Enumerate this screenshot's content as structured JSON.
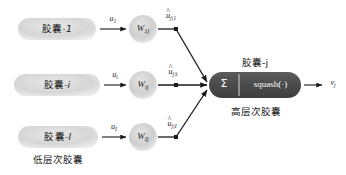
{
  "figure": {
    "type": "capsule-network-routing-diagram",
    "background": "#ffffff",
    "colors": {
      "low_capsule_fill": "#d9d9d9",
      "weight_circle_fill": "#d0d0d0",
      "high_capsule_fill": "#4d4d4d",
      "edge": "#1a1a1a",
      "text": "#1a1a1a",
      "capsule_text": "#ffffff"
    }
  },
  "low_level": {
    "group_label": "低层次胶囊",
    "capsules": [
      {
        "label_prefix": "胶囊",
        "label_suffix": "-1",
        "index": "1"
      },
      {
        "label_prefix": "胶囊",
        "label_suffix": "-i",
        "index": "i"
      },
      {
        "label_prefix": "胶囊",
        "label_suffix": "-I",
        "index": "I"
      }
    ]
  },
  "weights": {
    "nodes": [
      {
        "symbol": "W",
        "subscript": "1j"
      },
      {
        "symbol": "W",
        "subscript": "ij"
      },
      {
        "symbol": "W",
        "subscript": "Ij"
      }
    ]
  },
  "edges": {
    "inputs": [
      {
        "symbol": "u",
        "subscript": "1"
      },
      {
        "symbol": "u",
        "subscript": "i"
      },
      {
        "symbol": "u",
        "subscript": "I"
      }
    ],
    "predictions": [
      {
        "symbol": "u",
        "hat": "^",
        "subscript": "j|1"
      },
      {
        "symbol": "u",
        "hat": "^",
        "subscript": "j|i"
      },
      {
        "symbol": "u",
        "hat": "^",
        "subscript": "j|I"
      }
    ]
  },
  "high_level": {
    "title": "胶囊-j",
    "caption": "高层次胶囊",
    "sum_symbol": "Σ",
    "squash_label": "squash(·)",
    "output": {
      "symbol": "v",
      "subscript": "j"
    }
  }
}
